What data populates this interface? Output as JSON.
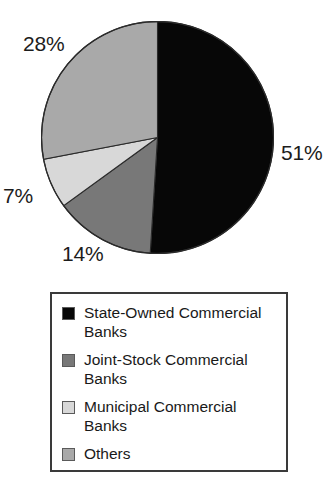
{
  "chart_data": {
    "type": "pie",
    "title": "",
    "subtitle": "",
    "xlabel": "",
    "ylabel": "",
    "grid": false,
    "legend_position": "bottom",
    "start_angle_deg": 0,
    "direction": "clockwise",
    "unit": "%",
    "categories": [
      "State-Owned Commercial Banks",
      "Joint-Stock Commercial Banks",
      "Municipal Commercial Banks",
      "Others"
    ],
    "values": [
      51,
      14,
      7,
      28
    ],
    "data_labels": [
      "51%",
      "14%",
      "7%",
      "28%"
    ],
    "colors": [
      "#070707",
      "#787878",
      "#d8d8d8",
      "#a9a9a9"
    ],
    "slices": [
      {
        "label": "State-Owned Commercial Banks",
        "value": 51,
        "data_label": "51%",
        "color": "#070707"
      },
      {
        "label": "Joint-Stock Commercial Banks",
        "value": 14,
        "data_label": "14%",
        "color": "#787878"
      },
      {
        "label": "Municipal Commercial Banks",
        "value": 7,
        "data_label": "7%",
        "color": "#d8d8d8"
      },
      {
        "label": "Others",
        "value": 28,
        "data_label": "28%",
        "color": "#a9a9a9"
      }
    ]
  },
  "pie": {
    "labels": {
      "state_owned_pct": "51%",
      "joint_stock_pct": "14%",
      "municipal_pct": "7%",
      "others_pct": "28%"
    }
  },
  "legend": {
    "items": [
      {
        "label": "State-Owned Commercial Banks",
        "color": "#070707"
      },
      {
        "label": "Joint-Stock Commercial Banks",
        "color": "#787878"
      },
      {
        "label": "Municipal Commercial Banks",
        "color": "#d8d8d8"
      },
      {
        "label": "Others",
        "color": "#a9a9a9"
      }
    ]
  }
}
